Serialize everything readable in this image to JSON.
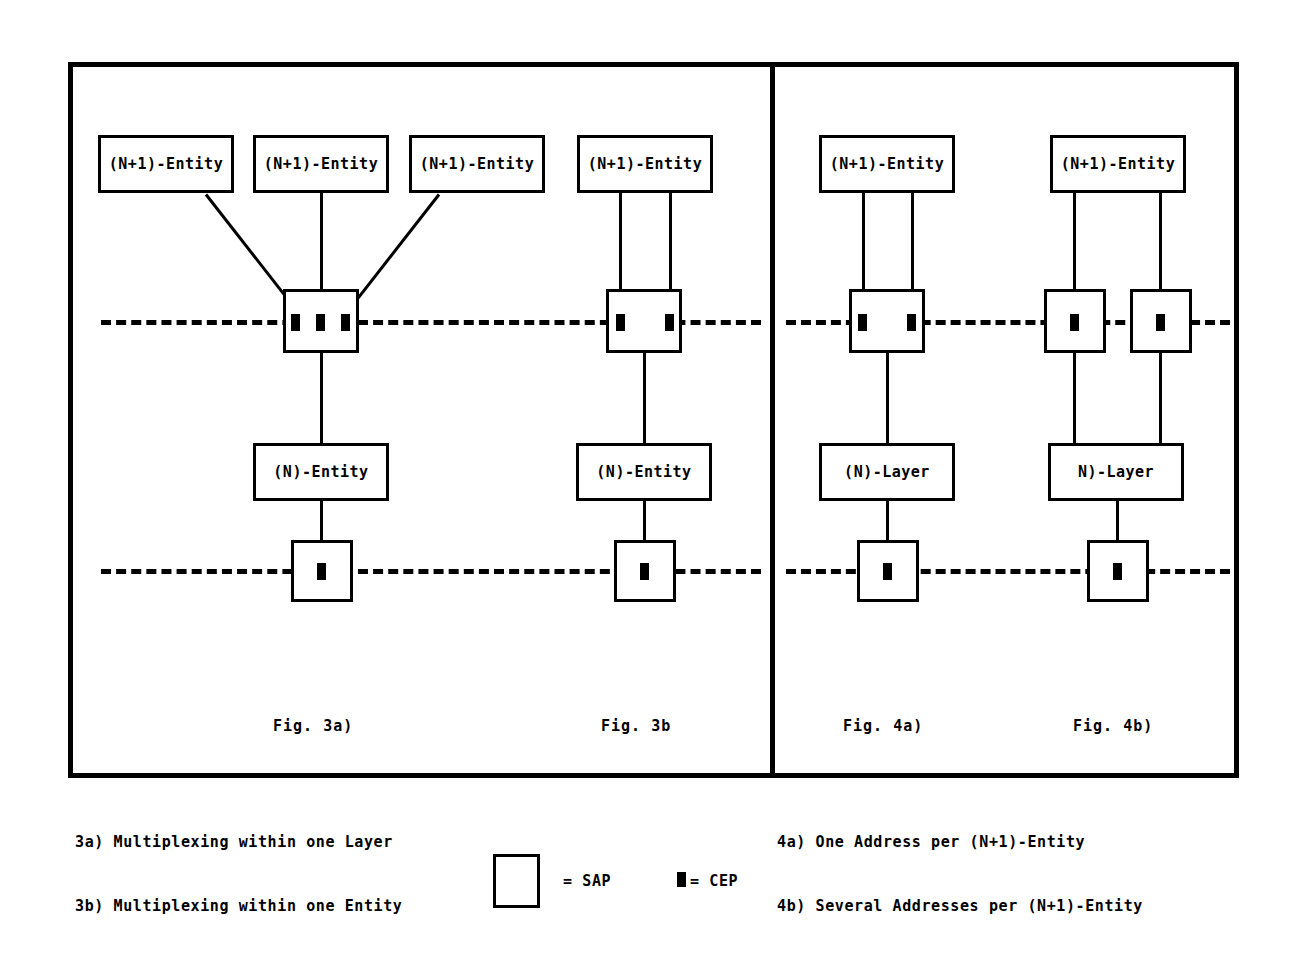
{
  "figure": {
    "panels": [
      {
        "id": "fig3a",
        "caption": "Fig. 3a)",
        "entities_top": [
          "(N+1)-Entity",
          "(N+1)-Entity",
          "(N+1)-Entity"
        ],
        "middle_box": "(N)-Entity",
        "top_sap_cep_count": 3,
        "bottom_sap_cep_count": 1
      },
      {
        "id": "fig3b",
        "caption": "Fig. 3b",
        "entities_top": [
          "(N+1)-Entity"
        ],
        "middle_box": "(N)-Entity",
        "top_sap_cep_count": 2,
        "bottom_sap_cep_count": 1
      },
      {
        "id": "fig4a",
        "caption": "Fig. 4a)",
        "entities_top": [
          "(N+1)-Entity"
        ],
        "middle_box": "(N)-Layer",
        "top_sap_cep_count": 2,
        "bottom_sap_cep_count": 1
      },
      {
        "id": "fig4b",
        "caption": "Fig. 4b)",
        "entities_top": [
          "(N+1)-Entity"
        ],
        "middle_box": "N)-Layer",
        "top_sap_cep_count": 2,
        "bottom_sap_cep_count": 1
      }
    ]
  },
  "legend": {
    "left_items": [
      "3a) Multiplexing within one Layer",
      "3b) Multiplexing within one Entity"
    ],
    "right_items": [
      "4a) One Address per (N+1)-Entity",
      "4b) Several Addresses per (N+1)-Entity"
    ],
    "sap_label": "= SAP",
    "cep_label": "= CEP"
  },
  "labels": {
    "entity_np1": "(N+1)-Entity",
    "entity_n": "(N)-Entity",
    "layer_n": "(N)-Layer",
    "layer_n_alt": "N)-Layer",
    "cap_3a": "Fig. 3a)",
    "cap_3b": "Fig. 3b",
    "cap_4a": "Fig. 4a)",
    "cap_4b": "Fig. 4b)"
  },
  "colors": {
    "ink": "#000000",
    "paper": "#ffffff"
  }
}
